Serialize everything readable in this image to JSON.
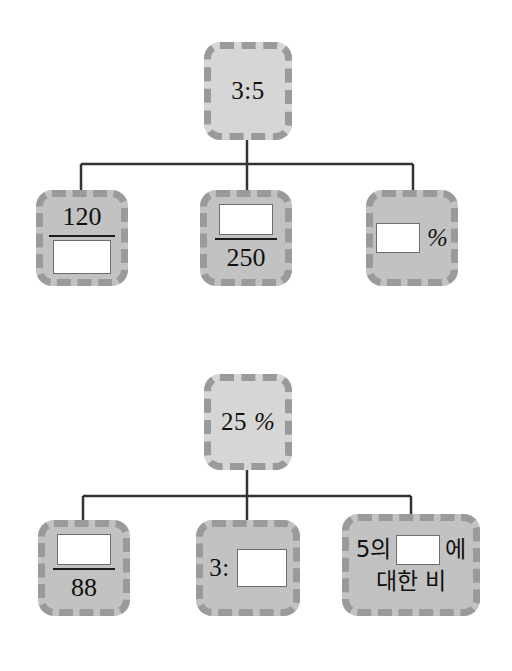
{
  "page": {
    "background_color": "#ffffff",
    "node_fill": "#c2c2c2",
    "root_fill": "#d6d6d6",
    "node_dash_color": "#9a9a9a",
    "connector_color": "#333333",
    "blank_fill": "#ffffff",
    "blank_border": "#6d6d6d"
  },
  "trees": [
    {
      "id": "tree-1",
      "root": {
        "label": "3:5",
        "parts": [
          {
            "kind": "text",
            "value": "3:5"
          }
        ]
      },
      "children": [
        {
          "id": "node-120-over-blank",
          "layout": "fraction",
          "numerator": "120",
          "denominator": "",
          "numerator_blank": false,
          "denominator_blank": true
        },
        {
          "id": "node-blank-over-250",
          "layout": "fraction",
          "numerator": "",
          "denominator": "250",
          "numerator_blank": true,
          "denominator_blank": false
        },
        {
          "id": "node-blank-percent",
          "layout": "inline",
          "parts": [
            {
              "kind": "blank",
              "value": ""
            },
            {
              "kind": "percent",
              "value": "%"
            }
          ]
        }
      ]
    },
    {
      "id": "tree-2",
      "root": {
        "label": "25 %",
        "parts": [
          {
            "kind": "text",
            "value": "25"
          },
          {
            "kind": "percent",
            "value": "%"
          }
        ]
      },
      "children": [
        {
          "id": "node-blank-over-88",
          "layout": "fraction",
          "numerator": "",
          "denominator": "88",
          "numerator_blank": true,
          "denominator_blank": false
        },
        {
          "id": "node-3-colon-blank",
          "layout": "inline",
          "parts": [
            {
              "kind": "text",
              "value": "3:"
            },
            {
              "kind": "blank",
              "value": ""
            }
          ]
        },
        {
          "id": "node-korean-ratio",
          "layout": "korean",
          "line1_before": "5의",
          "line1_blank": "",
          "line1_after": "에",
          "line2": "대한 비"
        }
      ]
    }
  ]
}
